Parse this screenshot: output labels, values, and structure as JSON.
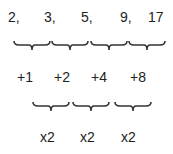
{
  "sequence": {
    "terms": [
      "2,",
      "3,",
      "5,",
      "9,",
      "17"
    ]
  },
  "first_differences": {
    "labels": [
      "+1",
      "+2",
      "+4",
      "+8"
    ]
  },
  "second_relations": {
    "labels": [
      "x2",
      "x2",
      "x2"
    ]
  },
  "colors": {
    "text": "#222222",
    "brace": "#333333",
    "background": "#ffffff"
  }
}
